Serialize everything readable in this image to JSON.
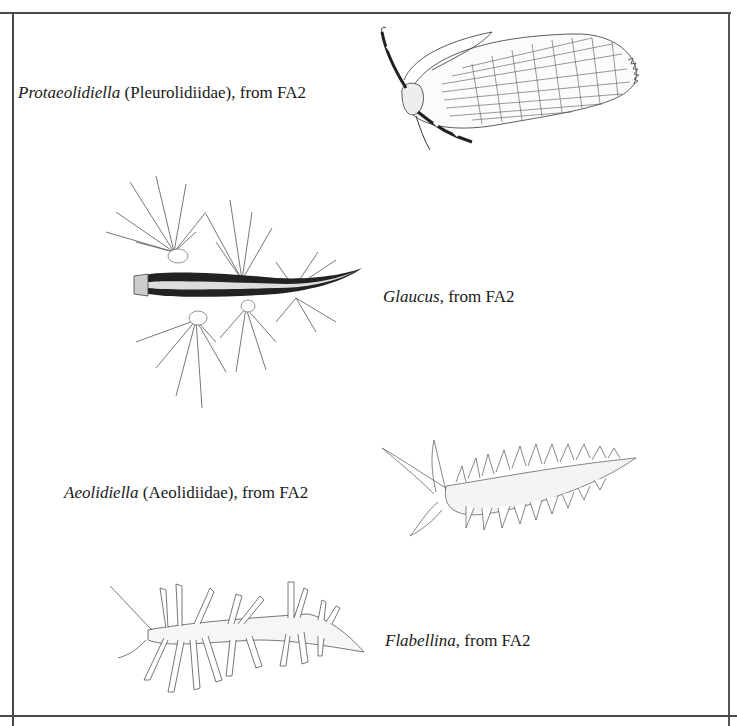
{
  "plates": [
    {
      "genus": "Protaeolidiella",
      "family": "(Pleurolidiidae)",
      "source": ", from FA2",
      "illustration": "protaeolidiella-drawing"
    },
    {
      "genus": "Glaucus",
      "family": "",
      "source": ", from FA2",
      "illustration": "glaucus-drawing"
    },
    {
      "genus": "Aeolidiella",
      "family": "(Aeolidiidae)",
      "source": ", from FA2",
      "illustration": "aeolidiella-drawing"
    },
    {
      "genus": "Flabellina",
      "family": "",
      "source": ", from FA2",
      "illustration": "flabellina-drawing"
    }
  ],
  "colors": {
    "border": "#4a4a4a",
    "ink": "#1a1a1a",
    "background": "#ffffff"
  }
}
